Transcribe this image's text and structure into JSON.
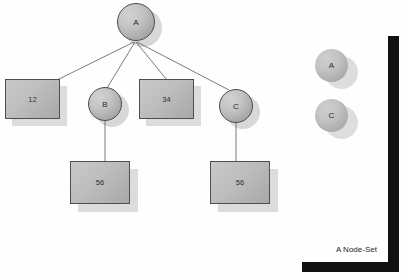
{
  "diagram": {
    "background_color": "#fefefe",
    "tree": {
      "root": {
        "label": "A",
        "shape": "circle"
      },
      "children": [
        {
          "label": "12",
          "shape": "rect"
        },
        {
          "label": "B",
          "shape": "circle"
        },
        {
          "label": "34",
          "shape": "rect"
        },
        {
          "label": "C",
          "shape": "circle"
        }
      ],
      "grandchildren": [
        {
          "label": "56",
          "shape": "rect",
          "parent": "B"
        },
        {
          "label": "56",
          "shape": "rect",
          "parent": "C"
        }
      ]
    },
    "panel": {
      "caption": "A Node-Set",
      "nodes": [
        {
          "label": "A",
          "shape": "circle"
        },
        {
          "label": "C",
          "shape": "circle"
        }
      ],
      "border_color": "#111111"
    },
    "colors": {
      "node_fill_light": "#d2d2d2",
      "node_fill_dark": "#979797",
      "node_stroke": "#4b4b4b",
      "shadow": "#d8d8d8",
      "edge": "#5a5a5a",
      "text": "#2a2a2a"
    }
  }
}
